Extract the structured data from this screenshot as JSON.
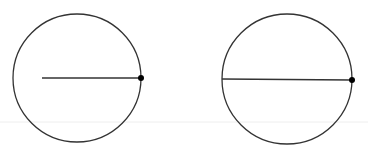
{
  "diagram": {
    "colors": {
      "stroke": "#333333",
      "point": "#000000",
      "baseline": "#eeeeee",
      "background": "#ffffff"
    },
    "figures": [
      {
        "name": "radius-figure",
        "circle": {
          "cx": 77,
          "cy": 78,
          "r": 64
        },
        "segment": {
          "x1": 42,
          "y1": 78,
          "x2": 141,
          "y2": 78
        },
        "point": {
          "cx": 141,
          "cy": 78,
          "r": 3
        }
      },
      {
        "name": "diameter-figure",
        "circle": {
          "cx": 287,
          "cy": 79,
          "r": 65
        },
        "segment": {
          "x1": 222,
          "y1": 79,
          "x2": 352,
          "y2": 80
        },
        "point": {
          "cx": 352,
          "cy": 80,
          "r": 3
        }
      }
    ],
    "baseline": {
      "y": 122
    }
  }
}
